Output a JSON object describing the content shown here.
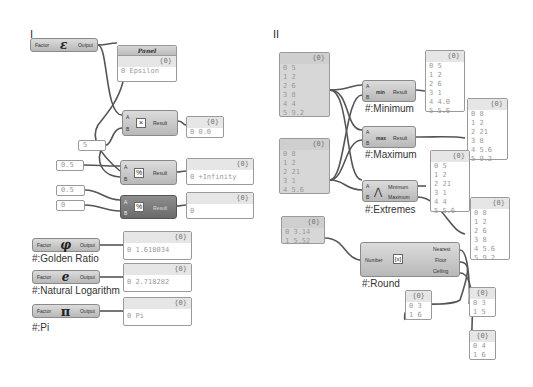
{
  "sections": {
    "left": "I",
    "right": "II"
  },
  "left": {
    "epsilon": {
      "input": "Factor",
      "glyph": "ε",
      "output": "Output"
    },
    "panel_epsilon": {
      "title": "Panel",
      "header": "{0}",
      "rows": [
        "0 Epsilon"
      ]
    },
    "multiply": {
      "a": "A",
      "b": "B",
      "icon": "×",
      "result": "Result"
    },
    "panel_multiply": {
      "header": "{0}",
      "rows": [
        "0 0.0"
      ]
    },
    "slider_5": "5",
    "slider_half_1": "0.5",
    "divide": {
      "a": "A",
      "b": "B",
      "icon": "%",
      "result": "Result"
    },
    "panel_divide": {
      "header": "{0}",
      "rows": [
        "0 +Infinity"
      ]
    },
    "slider_half_2": "0.5",
    "slider_zero": "0",
    "divide_error": {
      "a": "A",
      "b": "B",
      "icon": "%",
      "result": "Result"
    },
    "panel_divide_error": {
      "header": "{0}",
      "rows": [
        "0"
      ]
    },
    "golden": {
      "input": "Factor",
      "glyph": "φ",
      "output": "Output",
      "label": "#:Golden Ratio"
    },
    "panel_golden": {
      "header": "{0}",
      "rows": [
        "0 1.618034"
      ]
    },
    "natlog": {
      "input": "Factor",
      "glyph": "e",
      "output": "Output",
      "label": "#:Natural Logarithm"
    },
    "panel_natlog": {
      "header": "{0}",
      "rows": [
        "0 2.718282"
      ]
    },
    "pi": {
      "input": "Factor",
      "glyph": "π",
      "output": "Output",
      "label": "#:Pi"
    },
    "panel_pi": {
      "header": "{0}",
      "rows": [
        "0 Pi"
      ]
    }
  },
  "right": {
    "list_a": {
      "header": "{0}",
      "rows": [
        "0 5",
        "1 2",
        "2 6",
        "3 8",
        "4 4",
        "5 9.2"
      ]
    },
    "list_b": {
      "header": "{0}",
      "rows": [
        "0 8",
        "1 2",
        "2 21",
        "3 1",
        "4 5.6"
      ]
    },
    "minimum": {
      "a": "A",
      "b": "B",
      "icon": "min",
      "result": "Result",
      "label": "#:Minimum"
    },
    "panel_min": {
      "header": "{0}",
      "rows": [
        "0 5",
        "1 2",
        "2 6",
        "3 1",
        "4 4.0",
        "5 5.6"
      ]
    },
    "maximum": {
      "a": "A",
      "b": "B",
      "icon": "max",
      "result": "Result",
      "label": "#:Maximum"
    },
    "panel_max": {
      "header": "{0}",
      "rows": [
        "0 8",
        "1 2",
        "2 21",
        "3 8",
        "4 5.6",
        "5 9.2"
      ]
    },
    "extremes": {
      "a": "A",
      "b": "B",
      "icon": "⋀",
      "out1": "Minimum",
      "out2": "Maximum",
      "label": "#:Extremes"
    },
    "panel_ext_min": {
      "header": "{0}",
      "rows": [
        "0 5",
        "1 2",
        "2 21",
        "3 1",
        "4 4",
        "5 5.6"
      ]
    },
    "panel_ext_max": {
      "header": "{0}",
      "rows": [
        "0 8",
        "1 2",
        "2 6",
        "3 8",
        "4 5.6",
        "5 9.2"
      ]
    },
    "list_round": {
      "header": "{0}",
      "rows": [
        "0 3.14",
        "1 5.52"
      ]
    },
    "round": {
      "input": "Number",
      "icon": "[x]",
      "out1": "Nearest",
      "out2": "Floor",
      "out3": "Ceiling",
      "label": "#:Round"
    },
    "panel_nearest": {
      "header": "{0}",
      "rows": [
        "0 3",
        "1 6"
      ]
    },
    "panel_floor": {
      "header": "{0}",
      "rows": [
        "0 3",
        "1 5"
      ]
    },
    "panel_ceiling": {
      "header": "{0}",
      "rows": [
        "0 4",
        "1 6"
      ]
    }
  }
}
